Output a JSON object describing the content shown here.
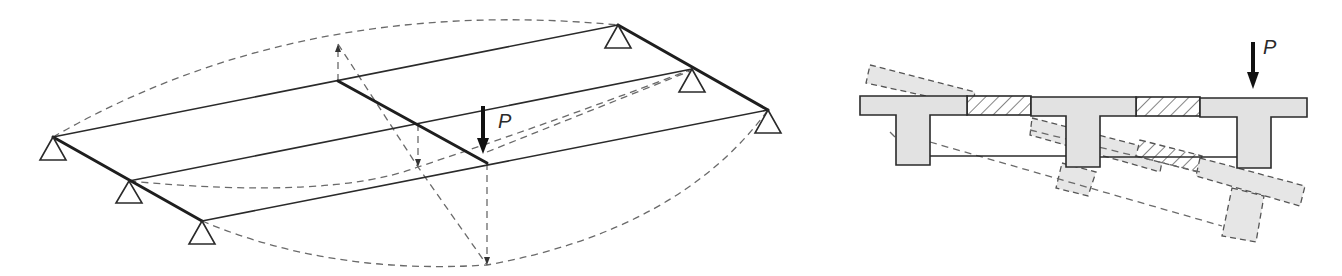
{
  "figure": {
    "left_panel": {
      "description": "Isometric grillage: three longitudinal beams with one transverse girder, simply supported at both ends, loaded by point load P",
      "load_label": "P",
      "supports_count": 6,
      "longitudinal_beams": 3,
      "transverse_girders": 1
    },
    "right_panel": {
      "description": "Cross-section of three T-beams connected by hatched slab strips, with dashed deflected/rotated shape under load P",
      "load_label": "P",
      "t_beams": 3,
      "hatched_connections": 2
    },
    "colors": {
      "line": "#2a2a2a",
      "dashed": "#6a6a6a",
      "section_fill": "#e2e2e2",
      "background": "#ffffff"
    }
  }
}
